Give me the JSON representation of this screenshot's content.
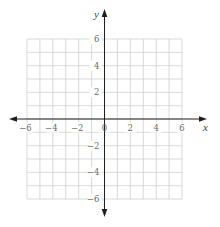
{
  "chart_data": {
    "type": "coordinate-grid",
    "title": "",
    "xlabel": "x",
    "ylabel": "y",
    "xlim": [
      -6,
      6
    ],
    "ylim": [
      -6,
      6
    ],
    "grid": true,
    "grid_step": 1,
    "x_ticks": [
      -6,
      -4,
      -2,
      0,
      2,
      4,
      6
    ],
    "y_ticks": [
      6,
      4,
      2,
      -2,
      -4,
      -6
    ],
    "x_tick_labels": [
      "−6",
      "−4",
      "−2",
      "0",
      "2",
      "4",
      "6"
    ],
    "y_tick_labels": [
      "6",
      "4",
      "2",
      "−2",
      "−4",
      "−6"
    ],
    "series": []
  },
  "axes": {
    "x_label": "x",
    "y_label": "y"
  },
  "colors": {
    "grid": "#cfcfcf",
    "axis": "#1e1e1e",
    "tick_text": "#6a6a6a"
  }
}
